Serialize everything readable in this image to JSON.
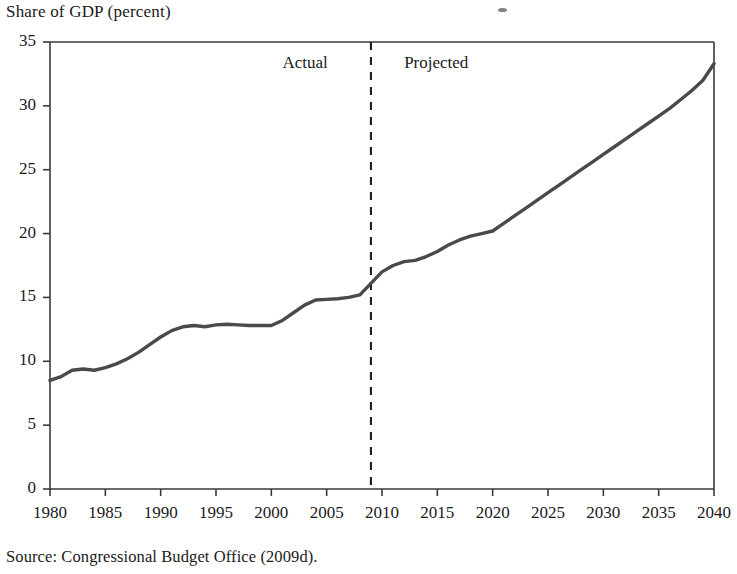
{
  "figure": {
    "axis_title": "Share of GDP (percent)",
    "source_note": "Source:  Congressional Budget Office (2009d).",
    "actual_label": "Actual",
    "projected_label": "Projected",
    "speck_name": "scan-artifact-speck"
  },
  "chart_data": {
    "type": "line",
    "title": "Share of GDP (percent)",
    "xlabel": "",
    "ylabel": "Share of GDP (percent)",
    "xlim": [
      1980,
      2040
    ],
    "ylim": [
      0,
      35
    ],
    "ytick_values": [
      0,
      5,
      10,
      15,
      20,
      25,
      30,
      35
    ],
    "ytick_labels": [
      "0",
      "5",
      "10",
      "15",
      "20",
      "25",
      "30",
      "35"
    ],
    "xtick_values": [
      1980,
      1985,
      1990,
      1995,
      2000,
      2005,
      2010,
      2015,
      2020,
      2025,
      2030,
      2035,
      2040
    ],
    "xtick_labels": [
      "1980",
      "1985",
      "1990",
      "1995",
      "2000",
      "2005",
      "2010",
      "2015",
      "2020",
      "2025",
      "2030",
      "2035",
      "2040"
    ],
    "grid": false,
    "legend": null,
    "line_color": "#4a4a4a",
    "line_width": 3.4,
    "divider_year": 2009,
    "divider_style": "dashed",
    "annotations": [
      {
        "text": "Actual",
        "x": 2001,
        "y": 33.3
      },
      {
        "text": "Projected",
        "x": 2012,
        "y": 33.3
      }
    ],
    "series": [
      {
        "name": "Federal spending share of GDP",
        "x": [
          1980,
          1981,
          1982,
          1983,
          1984,
          1985,
          1986,
          1987,
          1988,
          1989,
          1990,
          1991,
          1992,
          1993,
          1994,
          1995,
          1996,
          1997,
          1998,
          1999,
          2000,
          2001,
          2002,
          2003,
          2004,
          2005,
          2006,
          2007,
          2008,
          2009,
          2010,
          2011,
          2012,
          2013,
          2014,
          2015,
          2016,
          2017,
          2018,
          2019,
          2020,
          2021,
          2022,
          2023,
          2024,
          2025,
          2026,
          2027,
          2028,
          2029,
          2030,
          2031,
          2032,
          2033,
          2034,
          2035,
          2036,
          2037,
          2038,
          2039,
          2040
        ],
        "y": [
          8.5,
          8.8,
          9.3,
          9.4,
          9.3,
          9.5,
          9.8,
          10.2,
          10.7,
          11.3,
          11.9,
          12.4,
          12.7,
          12.8,
          12.7,
          12.85,
          12.9,
          12.85,
          12.8,
          12.8,
          12.8,
          13.2,
          13.8,
          14.4,
          14.8,
          14.85,
          14.9,
          15.0,
          15.2,
          16.1,
          17.0,
          17.5,
          17.8,
          17.9,
          18.2,
          18.6,
          19.1,
          19.5,
          19.8,
          20.0,
          20.2,
          20.8,
          21.4,
          22.0,
          22.6,
          23.2,
          23.8,
          24.4,
          25.0,
          25.6,
          26.2,
          26.8,
          27.4,
          28.0,
          28.6,
          29.2,
          29.8,
          30.5,
          31.2,
          32.0,
          33.3
        ]
      }
    ]
  }
}
